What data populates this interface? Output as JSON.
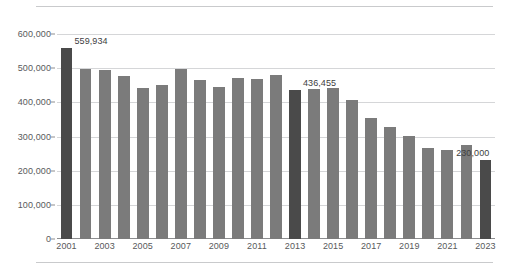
{
  "chart_data": {
    "type": "bar",
    "title": "",
    "subtitle": "",
    "xlabel": "",
    "ylabel": "",
    "ylim": [
      0,
      600000
    ],
    "ytick_values": [
      0,
      100000,
      200000,
      300000,
      400000,
      500000,
      600000
    ],
    "ytick_labels": [
      "0",
      "100,000",
      "200,000",
      "300,000",
      "400,000",
      "500,000",
      "600,000"
    ],
    "grid": true,
    "legend": "none",
    "categories": [
      "2001",
      "2002",
      "2003",
      "2004",
      "2005",
      "2006",
      "2007",
      "2008",
      "2009",
      "2010",
      "2011",
      "2012",
      "2013",
      "2014",
      "2015",
      "2016",
      "2017",
      "2018",
      "2019",
      "2020",
      "2021",
      "2022",
      "2023"
    ],
    "xtick_labels": [
      "2001",
      "2003",
      "2005",
      "2007",
      "2009",
      "2011",
      "2013",
      "2015",
      "2017",
      "2019",
      "2021",
      "2023"
    ],
    "values": [
      559934,
      497000,
      494000,
      476000,
      441000,
      452000,
      497000,
      464000,
      446000,
      470000,
      468000,
      481000,
      436455,
      440000,
      443000,
      406000,
      355000,
      327000,
      302000,
      265000,
      261000,
      274000,
      230000
    ],
    "highlighted_categories": [
      "2001",
      "2013",
      "2023"
    ],
    "data_labels": [
      {
        "category": "2001",
        "text": "559,934"
      },
      {
        "category": "2013",
        "text": "436,455"
      },
      {
        "category": "2023",
        "text": "230,000"
      }
    ],
    "colors": {
      "bar": "#7b7b7b",
      "bar_highlight": "#4a4a4a",
      "gridline": "#d5d6d8",
      "axis": "#8d8e90",
      "text": "#58595b",
      "rule": "#c9cacc"
    }
  }
}
